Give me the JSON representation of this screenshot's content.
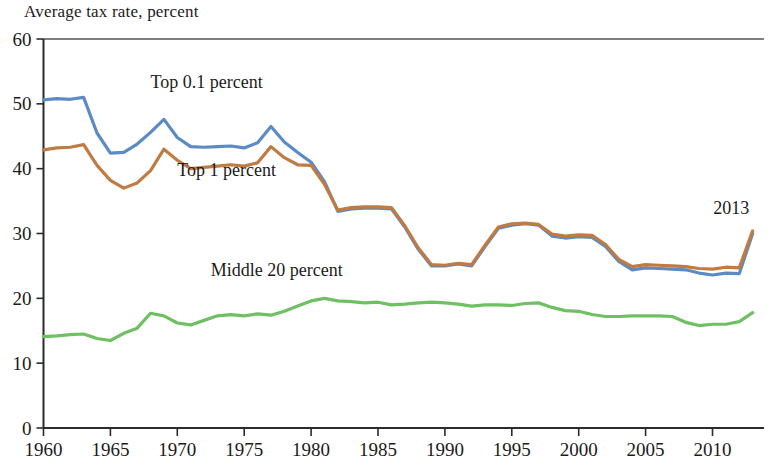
{
  "chart_data": {
    "type": "line",
    "title": "Average tax rate, percent",
    "xlabel": "",
    "ylabel": "Average tax rate, percent",
    "ylim": [
      0,
      60
    ],
    "xlim": [
      1960,
      2013
    ],
    "ytick_labels": [
      "0",
      "10",
      "20",
      "30",
      "40",
      "50",
      "60"
    ],
    "yticks": [
      0,
      10,
      20,
      30,
      40,
      50,
      60
    ],
    "xtick_labels": [
      "1960",
      "1965",
      "1970",
      "1975",
      "1980",
      "1985",
      "1990",
      "1995",
      "2000",
      "2005",
      "2010"
    ],
    "xticks": [
      1960,
      1965,
      1970,
      1975,
      1980,
      1985,
      1990,
      1995,
      2000,
      2005,
      2010
    ],
    "grid": false,
    "legend_position": "inline-labels",
    "annotations": [
      {
        "text": "2013",
        "x": 2011.4,
        "y": 33.0
      }
    ],
    "x": [
      1960,
      1961,
      1962,
      1963,
      1964,
      1965,
      1966,
      1967,
      1968,
      1969,
      1970,
      1971,
      1972,
      1973,
      1974,
      1975,
      1976,
      1977,
      1978,
      1979,
      1980,
      1981,
      1982,
      1983,
      1984,
      1985,
      1986,
      1987,
      1988,
      1989,
      1990,
      1991,
      1992,
      1993,
      1994,
      1995,
      1996,
      1997,
      1998,
      1999,
      2000,
      2001,
      2002,
      2003,
      2004,
      2005,
      2006,
      2007,
      2008,
      2009,
      2010,
      2011,
      2012,
      2013
    ],
    "series": [
      {
        "name": "Top 0.1 percent",
        "color": "#5b8ac5",
        "label_x": 1968.0,
        "label_y": 52.5,
        "values": [
          50.6,
          50.8,
          50.7,
          51.0,
          45.5,
          42.4,
          42.5,
          43.8,
          45.6,
          47.6,
          44.8,
          43.4,
          43.3,
          43.4,
          43.5,
          43.2,
          44.0,
          46.5,
          44.1,
          42.5,
          41.0,
          38.0,
          33.4,
          33.8,
          33.9,
          33.9,
          33.8,
          31.0,
          27.6,
          25.0,
          25.0,
          25.3,
          25.0,
          28.0,
          30.8,
          31.3,
          31.5,
          31.3,
          29.6,
          29.3,
          29.5,
          29.4,
          28.0,
          25.7,
          24.4,
          24.7,
          24.6,
          24.5,
          24.4,
          23.9,
          23.6,
          23.9,
          23.8,
          30.0
        ]
      },
      {
        "name": "Top 1 percent",
        "color": "#c07b42",
        "label_x": 1970.0,
        "label_y": 38.8,
        "values": [
          42.9,
          43.2,
          43.3,
          43.7,
          40.5,
          38.2,
          37.0,
          37.8,
          39.7,
          43.0,
          41.3,
          40.0,
          40.2,
          40.4,
          40.6,
          40.4,
          40.9,
          43.4,
          41.7,
          40.6,
          40.5,
          37.6,
          33.6,
          34.0,
          34.1,
          34.1,
          34.0,
          31.2,
          27.8,
          25.2,
          25.1,
          25.4,
          25.2,
          28.2,
          31.0,
          31.5,
          31.6,
          31.4,
          29.9,
          29.6,
          29.8,
          29.7,
          28.3,
          26.0,
          24.9,
          25.2,
          25.1,
          25.0,
          24.9,
          24.6,
          24.5,
          24.8,
          24.7,
          30.4
        ]
      },
      {
        "name": "Middle 20 percent",
        "color": "#6fbf63",
        "label_x": 1972.5,
        "label_y": 23.4,
        "values": [
          14.1,
          14.2,
          14.4,
          14.5,
          13.8,
          13.5,
          14.6,
          15.4,
          17.7,
          17.3,
          16.2,
          15.9,
          16.6,
          17.3,
          17.5,
          17.3,
          17.6,
          17.4,
          18.0,
          18.8,
          19.6,
          20.0,
          19.6,
          19.5,
          19.3,
          19.4,
          19.0,
          19.1,
          19.3,
          19.4,
          19.3,
          19.1,
          18.8,
          19.0,
          19.0,
          18.9,
          19.2,
          19.3,
          18.6,
          18.1,
          18.0,
          17.5,
          17.2,
          17.2,
          17.3,
          17.3,
          17.3,
          17.2,
          16.3,
          15.8,
          16.0,
          16.0,
          16.4,
          17.8
        ]
      }
    ]
  }
}
